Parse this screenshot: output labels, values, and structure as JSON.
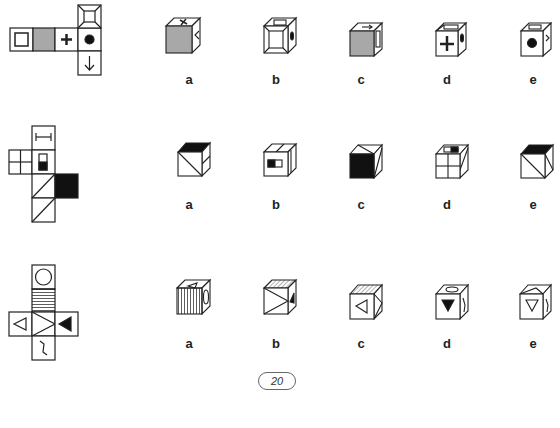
{
  "puzzle": {
    "type": "cube-folding",
    "page_number": "20",
    "rows": [
      {
        "net": {
          "faces": [
            "hollow-square",
            "gray-fill",
            "plus",
            "black-dot",
            "frame-bevel",
            "down-arrow"
          ]
        },
        "options": [
          {
            "label": "a",
            "front": "gray-fill",
            "top": "plus",
            "side": "arrow"
          },
          {
            "label": "b",
            "front": "frame-bevel",
            "top": "hollow-square",
            "side": "black-dot"
          },
          {
            "label": "c",
            "front": "gray-fill",
            "top": "arrow",
            "side": "hollow-square"
          },
          {
            "label": "d",
            "front": "plus",
            "top": "frame-bevel",
            "side": "black-dot"
          },
          {
            "label": "e",
            "front": "black-dot",
            "top": "hollow-square",
            "side": "arrow"
          }
        ]
      },
      {
        "net": {
          "faces": [
            "i-beam",
            "four-grid",
            "half-black-rect",
            "diagonal",
            "black-fill",
            "diagonal"
          ]
        },
        "options": [
          {
            "label": "a",
            "front": "diagonal",
            "top": "black-fill",
            "side": "i-beam"
          },
          {
            "label": "b",
            "front": "half-black-rect",
            "top": "i-beam",
            "side": "i-beam"
          },
          {
            "label": "c",
            "front": "black-fill",
            "top": "diagonal",
            "side": "diagonal"
          },
          {
            "label": "d",
            "front": "four-grid",
            "top": "half-black-rect",
            "side": "diagonal"
          },
          {
            "label": "e",
            "front": "diagonal",
            "top": "black-fill",
            "side": "diagonal"
          }
        ]
      },
      {
        "net": {
          "faces": [
            "circle",
            "stripes",
            "hollow-triangle-left",
            "chevron-right",
            "black-triangle-left",
            "squiggle"
          ]
        },
        "options": [
          {
            "label": "a",
            "front": "stripes-vertical",
            "top": "hollow-triangle",
            "side": "circle"
          },
          {
            "label": "b",
            "front": "chevron",
            "top": "stripes",
            "side": "black-triangle"
          },
          {
            "label": "c",
            "front": "hollow-triangle-left",
            "top": "stripes",
            "side": "chevron"
          },
          {
            "label": "d",
            "front": "black-triangle-down",
            "top": "circle",
            "side": "squiggle"
          },
          {
            "label": "e",
            "front": "hollow-triangle-down",
            "top": "chevron",
            "side": "squiggle"
          }
        ]
      }
    ]
  },
  "labels": {
    "row1": [
      "a",
      "b",
      "c",
      "d",
      "e"
    ],
    "row2": [
      "a",
      "b",
      "c",
      "d",
      "e"
    ],
    "row3": [
      "a",
      "b",
      "c",
      "d",
      "e"
    ]
  },
  "colors": {
    "gray": "#a8a8a8",
    "black": "#111111",
    "line": "#222222"
  }
}
